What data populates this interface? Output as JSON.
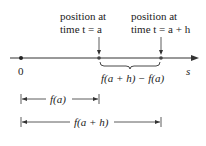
{
  "labels": {
    "pos_a_line1": "position at",
    "pos_a_line2": "time t = a",
    "pos_ah_line1": "position at",
    "pos_ah_line2": "time t = a + h",
    "origin": "0",
    "axis": "s",
    "difference": "f(a + h) − f(a)",
    "fa": "f(a)",
    "fah": "f(a + h)"
  }
}
